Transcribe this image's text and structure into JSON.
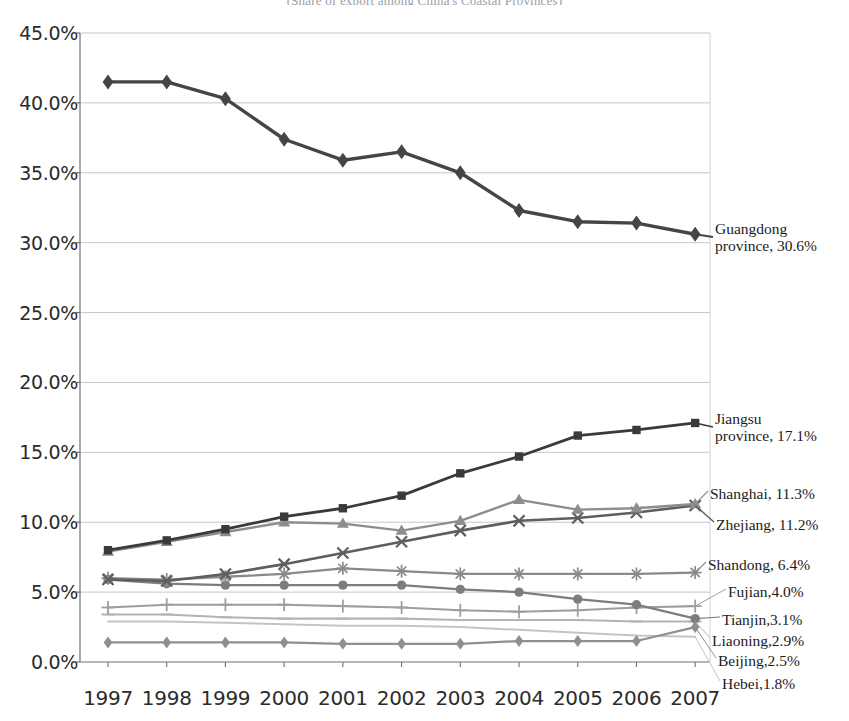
{
  "chart_data": {
    "type": "line",
    "title": "(Share of export among China's Coastal Provinces)",
    "xlabel": "",
    "ylabel": "",
    "x": [
      "1997",
      "1998",
      "1999",
      "2000",
      "2001",
      "2002",
      "2003",
      "2004",
      "2005",
      "2006",
      "2007"
    ],
    "ylim": [
      0,
      45
    ],
    "ytick_labels": [
      "0.0%",
      "5.0%",
      "10.0%",
      "15.0%",
      "20.0%",
      "25.0%",
      "30.0%",
      "35.0%",
      "40.0%",
      "45.0%"
    ],
    "ytick_values": [
      0,
      5,
      10,
      15,
      20,
      25,
      30,
      35,
      40,
      45
    ],
    "grid": true,
    "legend_position": "right-inline-callouts",
    "series": [
      {
        "name": "Guangdong",
        "label_line1": "Guangdong",
        "label_line2": "province, 30.6%",
        "marker": "diamond",
        "color": "#454545",
        "width": 3.4,
        "values": [
          41.5,
          41.5,
          40.3,
          37.4,
          35.9,
          36.5,
          35.0,
          32.3,
          31.5,
          31.4,
          30.6
        ]
      },
      {
        "name": "Jiangsu",
        "label_line1": "Jiangsu",
        "label_line2": "province, 17.1%",
        "marker": "square",
        "color": "#3a3a3a",
        "width": 2.8,
        "values": [
          8.0,
          8.7,
          9.5,
          10.4,
          11.0,
          11.9,
          13.5,
          14.7,
          16.2,
          16.6,
          17.1
        ]
      },
      {
        "name": "Shanghai",
        "label_line1": "Shanghai, 11.3%",
        "label_line2": "",
        "marker": "triangle",
        "color": "#8d8d8d",
        "width": 2.4,
        "values": [
          7.9,
          8.6,
          9.3,
          10.0,
          9.9,
          9.4,
          10.1,
          11.6,
          10.9,
          11.0,
          11.3
        ]
      },
      {
        "name": "Zhejiang",
        "label_line1": "Zhejiang, 11.2%",
        "label_line2": "",
        "marker": "cross",
        "color": "#5e5e5e",
        "width": 2.6,
        "values": [
          5.9,
          5.8,
          6.3,
          7.0,
          7.8,
          8.6,
          9.4,
          10.1,
          10.3,
          10.7,
          11.2
        ]
      },
      {
        "name": "Shandong",
        "label_line1": "Shandong, 6.4%",
        "label_line2": "",
        "marker": "star",
        "color": "#8a8a8a",
        "width": 2.3,
        "values": [
          6.0,
          5.9,
          6.1,
          6.3,
          6.7,
          6.5,
          6.3,
          6.3,
          6.3,
          6.3,
          6.4
        ]
      },
      {
        "name": "Fujian",
        "label_line1": "Fujian,4.0%",
        "label_line2": "",
        "marker": "plus",
        "color": "#9e9e9e",
        "width": 2.1,
        "values": [
          3.9,
          4.1,
          4.1,
          4.1,
          4.0,
          3.9,
          3.7,
          3.6,
          3.7,
          3.9,
          4.0
        ]
      },
      {
        "name": "Tianjin",
        "label_line1": "Tianjin,3.1%",
        "label_line2": "",
        "marker": "circle",
        "color": "#7d7d7d",
        "width": 2.3,
        "values": [
          5.9,
          5.6,
          5.5,
          5.5,
          5.5,
          5.5,
          5.2,
          5.0,
          4.5,
          4.1,
          3.1
        ]
      },
      {
        "name": "Liaoning",
        "label_line1": "Liaoning,2.9%",
        "label_line2": "",
        "marker": "dash",
        "color": "#b4b4b4",
        "width": 2.1,
        "values": [
          3.4,
          3.4,
          3.2,
          3.1,
          3.1,
          3.1,
          3.0,
          3.0,
          3.0,
          2.9,
          2.9
        ]
      },
      {
        "name": "Beijing",
        "label_line1": "Beijing,2.5%",
        "label_line2": "",
        "marker": "diamond-small",
        "color": "#8f8f8f",
        "width": 2.2,
        "values": [
          1.4,
          1.4,
          1.4,
          1.4,
          1.3,
          1.3,
          1.3,
          1.5,
          1.5,
          1.5,
          2.5
        ]
      },
      {
        "name": "Hebei",
        "label_line1": "Hebei,1.8%",
        "label_line2": "",
        "marker": "none",
        "color": "#c4c4c4",
        "width": 2.0,
        "values": [
          2.9,
          2.9,
          2.8,
          2.7,
          2.6,
          2.6,
          2.5,
          2.3,
          2.1,
          1.9,
          1.8
        ]
      }
    ],
    "callouts": [
      {
        "name": "Guangdong",
        "line1": "Guangdong",
        "line2": "province, 30.6%",
        "x": 715,
        "y": 220
      },
      {
        "name": "Jiangsu",
        "line1": "Jiangsu",
        "line2": "province, 17.1%",
        "x": 715,
        "y": 410
      },
      {
        "name": "Shanghai",
        "line1": "Shanghai, 11.3%",
        "line2": "",
        "x": 710,
        "y": 485
      },
      {
        "name": "Zhejiang",
        "line1": "Zhejiang, 11.2%",
        "line2": "",
        "x": 716,
        "y": 516
      },
      {
        "name": "Shandong",
        "line1": "Shandong, 6.4%",
        "line2": "",
        "x": 708,
        "y": 556
      },
      {
        "name": "Fujian",
        "line1": "Fujian,4.0%",
        "line2": "",
        "x": 728,
        "y": 583
      },
      {
        "name": "Tianjin",
        "line1": "Tianjin,3.1%",
        "line2": "",
        "x": 722,
        "y": 611
      },
      {
        "name": "Liaoning",
        "line1": "Liaoning,2.9%",
        "line2": "",
        "x": 712,
        "y": 632
      },
      {
        "name": "Beijing",
        "line1": "Beijing,2.5%",
        "line2": "",
        "x": 718,
        "y": 652
      },
      {
        "name": "Hebei",
        "line1": "Hebei,1.8%",
        "line2": "",
        "x": 722,
        "y": 675
      }
    ]
  }
}
